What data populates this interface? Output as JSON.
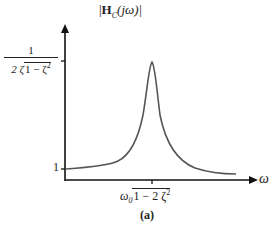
{
  "figure": {
    "y_axis_label_prefix": "|",
    "y_axis_label_main": "H",
    "y_axis_label_sub": "C",
    "y_axis_label_suffix": "(jω)|",
    "peak_value_numerator": "1",
    "peak_value_denominator_prefix": "2 ζ",
    "peak_value_denominator_radicand": "1 − ζ",
    "peak_value_denominator_exp": "2",
    "baseline_value": "1",
    "x_axis_label": "ω",
    "peak_frequency_prefix": "ω",
    "peak_frequency_sub": "0",
    "peak_frequency_radicand": "1 − 2 ζ",
    "peak_frequency_exp": "2",
    "caption": "(a)",
    "colors": {
      "axis": "#111111",
      "curve": "#555555"
    }
  }
}
